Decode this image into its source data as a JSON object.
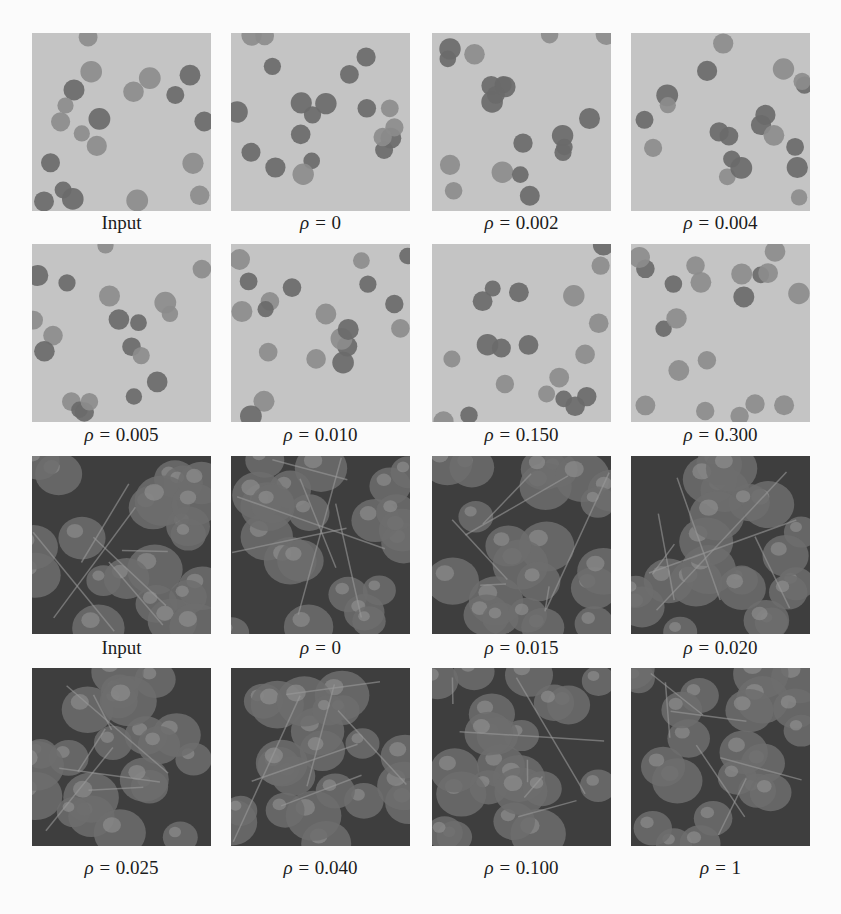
{
  "figure": {
    "rows": [
      {
        "texture": "dots",
        "tiles": [
          {
            "label_prefix": "",
            "label_value": "Input"
          },
          {
            "label_prefix": "ρ = ",
            "label_value": "0"
          },
          {
            "label_prefix": "ρ = ",
            "label_value": "0.002"
          },
          {
            "label_prefix": "ρ = ",
            "label_value": "0.004"
          }
        ]
      },
      {
        "texture": "dots",
        "tiles": [
          {
            "label_prefix": "ρ = ",
            "label_value": "0.005"
          },
          {
            "label_prefix": "ρ = ",
            "label_value": "0.010"
          },
          {
            "label_prefix": "ρ = ",
            "label_value": "0.150"
          },
          {
            "label_prefix": "ρ = ",
            "label_value": "0.300"
          }
        ]
      },
      {
        "texture": "berries",
        "tiles": [
          {
            "label_prefix": "",
            "label_value": "Input"
          },
          {
            "label_prefix": "ρ = ",
            "label_value": "0"
          },
          {
            "label_prefix": "ρ = ",
            "label_value": "0.015"
          },
          {
            "label_prefix": "ρ = ",
            "label_value": "0.020"
          }
        ]
      },
      {
        "texture": "berries",
        "tiles": [
          {
            "label_prefix": "ρ = ",
            "label_value": "0.025"
          },
          {
            "label_prefix": "ρ = ",
            "label_value": "0.040"
          },
          {
            "label_prefix": "ρ = ",
            "label_value": "0.100"
          },
          {
            "label_prefix": "ρ = ",
            "label_value": "1"
          }
        ]
      }
    ]
  },
  "colors": {
    "page": "#fbfbfb",
    "dots_bg": "#c4c4c4",
    "dot_dark": "#6a6a6a",
    "dot_mid": "#8c8c8c",
    "berry_bg": "#3e3e3e",
    "berry_mid": "#6d6d6d",
    "berry_light": "#9a9a9a"
  }
}
